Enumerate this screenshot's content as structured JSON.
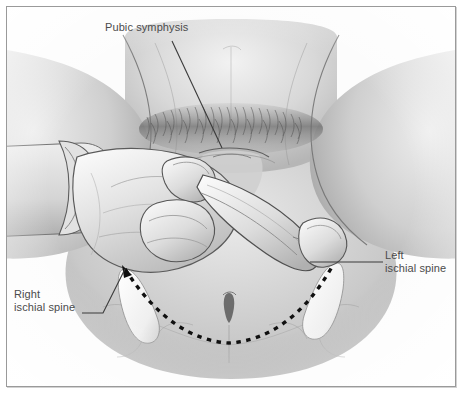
{
  "figure": {
    "type": "grayscale medical illustration",
    "frame_color": "#9a9a9a",
    "background_color": "#fcfcfc",
    "label_color": "#4b4b4b",
    "dashed_line_color": "#101010"
  },
  "labels": {
    "pubic_symphysis": "Pubic symphysis",
    "left_ischial_spine_line1": "Left",
    "left_ischial_spine_line2": "ischial spine",
    "right_ischial_spine_line1": "Right",
    "right_ischial_spine_line2": "ischial spine"
  },
  "annotations": {
    "interspinous_line_style": "dashed",
    "arrowhead_target": "right ischial spine"
  }
}
